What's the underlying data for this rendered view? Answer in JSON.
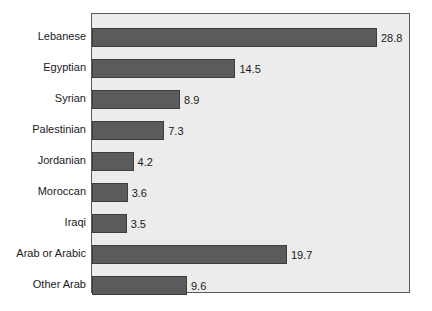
{
  "chart_data": {
    "type": "bar",
    "orientation": "horizontal",
    "title": "",
    "subtitle": "",
    "xlabel": "",
    "ylabel": "",
    "categories": [
      "Lebanese",
      "Egyptian",
      "Syrian",
      "Palestinian",
      "Jordanian",
      "Moroccan",
      "Iraqi",
      "Arab or Arabic",
      "Other Arab"
    ],
    "values": [
      28.8,
      14.5,
      8.9,
      7.3,
      4.2,
      3.6,
      3.5,
      19.7,
      9.6
    ],
    "value_labels": [
      "28.8",
      "14.5",
      "8.9",
      "7.3",
      "4.2",
      "3.6",
      "3.5",
      "19.7",
      "9.6"
    ],
    "xlim": [
      0,
      32
    ],
    "grid": false,
    "legend": null,
    "legend_position": "none",
    "tick_labels": {
      "x": [],
      "y": [
        "Lebanese",
        "Egyptian",
        "Syrian",
        "Palestinian",
        "Jordanian",
        "Moroccan",
        "Iraqi",
        "Arab or Arabic",
        "Other Arab"
      ]
    },
    "annotations": [],
    "colors": {
      "bar_fill": "#5b5b5b",
      "bar_edge": "#3d3d3d",
      "plot_background": "#ececec",
      "plot_border": "#5a5a5a",
      "figure_background": "#ffffff",
      "text": "#1a1a1a"
    }
  }
}
